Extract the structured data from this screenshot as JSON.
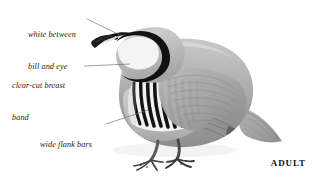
{
  "plate": {
    "subject": "chukar-partridge",
    "background_color": "#ffffff",
    "age_caption": "ADULT",
    "callouts": [
      {
        "id": "white-between-bill-and-eye",
        "line1": "white between",
        "line2": "bill and eye",
        "text": "white between bill and eye",
        "text_x": 28,
        "text_y": 9,
        "leader": {
          "x1": 87,
          "y1": 19,
          "x2": 122,
          "y2": 36
        }
      },
      {
        "id": "clear-cut-breast-band",
        "line1": "clear-cut breast",
        "line2": "band",
        "text": "clear-cut breast band",
        "text_x": 12,
        "text_y": 60,
        "leader": {
          "x1": 84,
          "y1": 66,
          "x2": 130,
          "y2": 64
        }
      },
      {
        "id": "wide-flank-bars",
        "line1": "wide flank bars",
        "line2": "",
        "text": "wide flank bars",
        "text_x": 40,
        "text_y": 119,
        "leader": {
          "x1": 106,
          "y1": 124,
          "x2": 148,
          "y2": 110
        }
      }
    ],
    "colors": {
      "leader_line": "#6e6e6e",
      "ink_black": "#111111",
      "plumage_mid_gray": "#a8a8a8",
      "plumage_light_gray": "#cfcfcf",
      "plumage_dark_gray": "#7d7d7d",
      "throat_white": "#f4f4f4",
      "flank_bar_black": "#141414",
      "flank_bar_white": "#f2f2f2",
      "bill_black": "#1c1c1c",
      "leg_dark": "#4a4a4a"
    },
    "anatomy": {
      "flank_bar_count": 12,
      "orientation": "facing-left",
      "posture": "standing"
    }
  }
}
